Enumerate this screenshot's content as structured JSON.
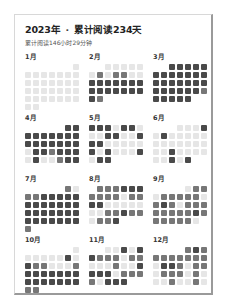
{
  "header": {
    "year": "2023年",
    "separator": "·",
    "days_label": "累计阅读234天",
    "subtitle": "累计阅读146小时29分钟"
  },
  "legend_levels": {
    "l1": "#e6e6e6",
    "l2": "#b8b8b8",
    "l3": "#777777",
    "l4": "#4a4a4a"
  },
  "months": [
    {
      "label": "1月",
      "offset": 6,
      "days": [
        1,
        1,
        1,
        1,
        1,
        1,
        1,
        1,
        1,
        1,
        1,
        1,
        1,
        1,
        1,
        1,
        1,
        1,
        1,
        1,
        1,
        1,
        1,
        1,
        1,
        1,
        1,
        1,
        1,
        1,
        1
      ]
    },
    {
      "label": "2月",
      "offset": 2,
      "days": [
        1,
        1,
        1,
        1,
        1,
        1,
        3,
        1,
        3,
        3,
        1,
        1,
        4,
        4,
        4,
        4,
        4,
        4,
        4,
        4,
        4,
        4,
        4,
        4,
        4,
        4,
        4,
        3
      ]
    },
    {
      "label": "3月",
      "offset": 2,
      "days": [
        4,
        4,
        4,
        4,
        4,
        4,
        4,
        4,
        4,
        4,
        4,
        4,
        4,
        4,
        4,
        4,
        4,
        4,
        4,
        4,
        4,
        4,
        4,
        4,
        4,
        3,
        4,
        4,
        4,
        4,
        4
      ]
    },
    {
      "label": "4月",
      "offset": 5,
      "days": [
        4,
        4,
        4,
        4,
        4,
        4,
        4,
        4,
        4,
        4,
        4,
        4,
        4,
        4,
        4,
        4,
        1,
        4,
        4,
        3,
        4,
        4,
        4,
        1,
        4,
        1,
        1,
        3,
        4,
        4
      ]
    },
    {
      "label": "5月",
      "offset": 0,
      "days": [
        4,
        4,
        4,
        1,
        4,
        4,
        1,
        1,
        1,
        4,
        4,
        1,
        1,
        4,
        4,
        4,
        1,
        1,
        1,
        1,
        1,
        4,
        1,
        4,
        1,
        1,
        1,
        4,
        1,
        4,
        4
      ]
    },
    {
      "label": "6月",
      "offset": 3,
      "days": [
        1,
        1,
        1,
        4,
        1,
        4,
        1,
        1,
        1,
        1,
        1,
        1,
        1,
        1,
        1,
        1,
        1,
        1,
        1,
        1,
        4,
        1,
        1,
        1,
        1,
        1,
        1,
        4,
        1,
        4
      ]
    },
    {
      "label": "7月",
      "offset": 5,
      "days": [
        3,
        1,
        3,
        3,
        4,
        4,
        4,
        4,
        4,
        4,
        4,
        4,
        4,
        4,
        4,
        4,
        4,
        4,
        4,
        4,
        4,
        4,
        4,
        4,
        4,
        4,
        4,
        4,
        4,
        4,
        3
      ]
    },
    {
      "label": "8月",
      "offset": 1,
      "days": [
        3,
        3,
        3,
        4,
        4,
        4,
        3,
        3,
        3,
        3,
        1,
        3,
        3,
        4,
        4,
        1,
        1,
        1,
        1,
        1,
        1,
        1,
        3,
        3,
        4,
        3,
        3,
        1,
        3,
        3,
        4
      ]
    },
    {
      "label": "9月",
      "offset": 4,
      "days": [
        1,
        3,
        3,
        1,
        3,
        3,
        3,
        3,
        3,
        1,
        3,
        4,
        3,
        1,
        3,
        3,
        3,
        3,
        3,
        3,
        3,
        3,
        4,
        3,
        3,
        3,
        3,
        3,
        3,
        1
      ]
    },
    {
      "label": "10月",
      "offset": 6,
      "days": [
        1,
        1,
        1,
        1,
        1,
        1,
        4,
        1,
        4,
        3,
        3,
        1,
        1,
        1,
        3,
        4,
        4,
        4,
        4,
        4,
        4,
        4,
        4,
        4,
        4,
        4,
        4,
        4,
        4,
        3,
        3
      ]
    },
    {
      "label": "11月",
      "offset": 2,
      "days": [
        1,
        1,
        4,
        1,
        4,
        4,
        3,
        3,
        3,
        1,
        3,
        3,
        1,
        1,
        1,
        3,
        1,
        1,
        4,
        4,
        4,
        4,
        1,
        3,
        3,
        3,
        3,
        1,
        4,
        4,
        4
      ]
    },
    {
      "label": "12月",
      "offset": 4,
      "days": [
        3,
        4,
        3,
        3,
        3,
        3,
        3,
        3,
        3,
        3,
        1,
        4,
        4,
        3,
        1,
        3,
        3,
        1,
        3,
        3,
        3,
        1,
        3,
        1,
        1,
        1,
        3,
        1,
        1,
        3,
        1
      ]
    }
  ]
}
